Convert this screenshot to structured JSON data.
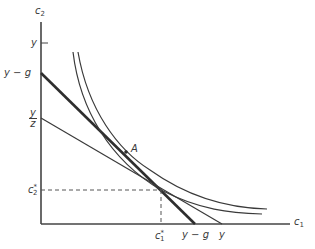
{
  "diagram": {
    "axes": {
      "y_axis_label": "c",
      "y_axis_sub": "2",
      "x_axis_label": "c",
      "x_axis_sub": "1"
    },
    "y_ticks": {
      "y": "y",
      "y_minus_g": "y − g",
      "y_over_z_num": "y",
      "y_over_z_den": "z",
      "c2_star_base": "c",
      "c2_star_sub": "2",
      "c2_star_sup": "*"
    },
    "x_ticks": {
      "c1_star_base": "c",
      "c1_star_sub": "1",
      "c1_star_sup": "*",
      "y_minus_g": "y − g",
      "y": "y"
    },
    "point_label": "A",
    "colors": {
      "line": "#3a3a3a",
      "background": "#ffffff"
    }
  }
}
